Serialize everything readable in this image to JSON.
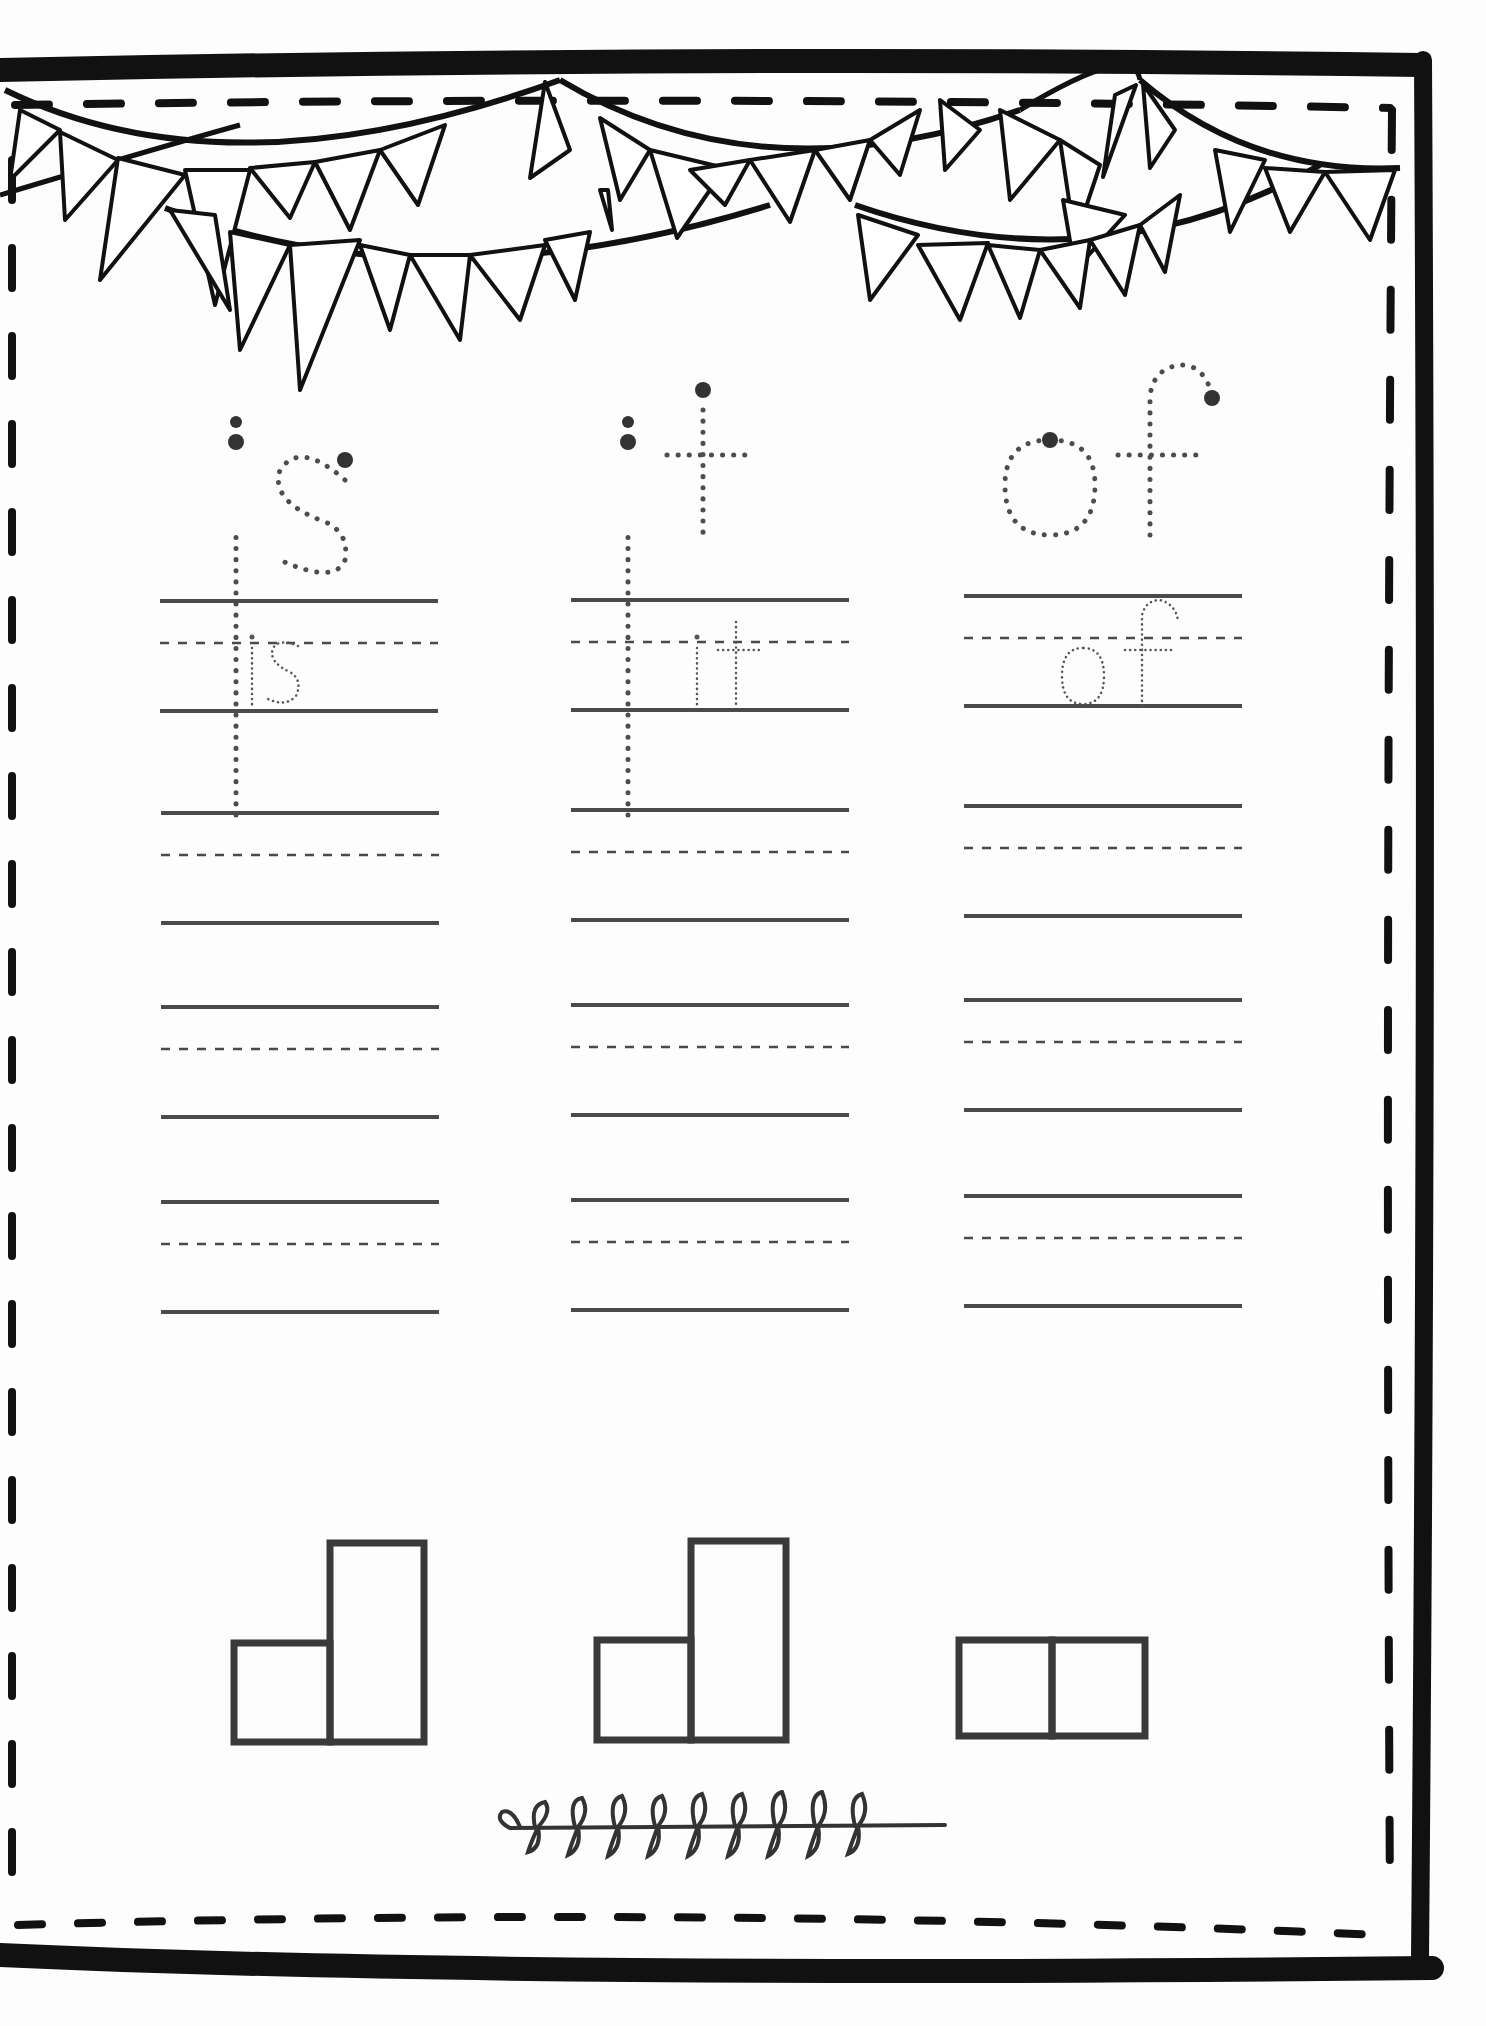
{
  "worksheet": {
    "title": "Sight word tracing worksheet",
    "colors": {
      "ink": "#111111",
      "line": "#4a4a4a",
      "trace_dot": "#4d4d4d",
      "paper": "#fdfdfd"
    },
    "words": [
      {
        "word": "is",
        "trace_example": "is",
        "practice_rows": 4,
        "word_shape": [
          "short",
          "tall"
        ]
      },
      {
        "word": "it",
        "trace_example": "it",
        "practice_rows": 4,
        "word_shape": [
          "short",
          "tall"
        ]
      },
      {
        "word": "of",
        "trace_example": "of",
        "practice_rows": 4,
        "word_shape": [
          "short",
          "short"
        ]
      }
    ],
    "decorations": {
      "top": "bunting-banner",
      "bottom": "leaf-sprig",
      "border": "thick-frame-with-dashed-inner-border"
    }
  }
}
